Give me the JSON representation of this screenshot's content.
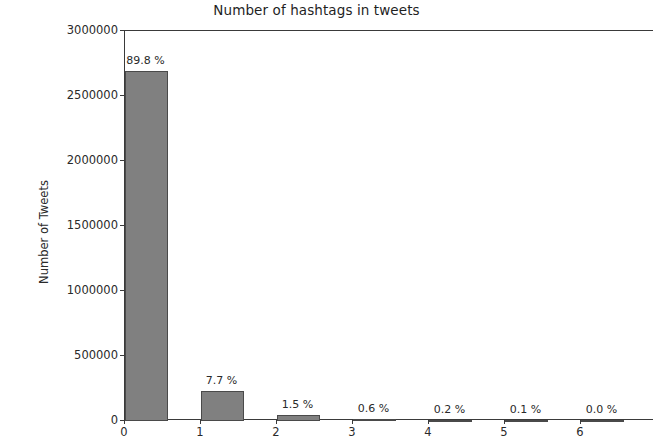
{
  "chart_data": {
    "type": "bar",
    "title": "Number of hashtags in tweets",
    "xlabel": "",
    "ylabel": "Number of Tweets",
    "categories": [
      "0",
      "1",
      "2",
      "3",
      "4",
      "5",
      "6"
    ],
    "values": [
      2694000,
      231000,
      45000,
      18000,
      6000,
      3000,
      1000
    ],
    "data_labels": [
      "89.8 %",
      "7.7 %",
      "1.5 %",
      "0.6 %",
      "0.2 %",
      "0.1 %",
      "0.0 %"
    ],
    "percentages": [
      89.8,
      7.7,
      1.5,
      0.6,
      0.2,
      0.1,
      0.0
    ],
    "ylim": [
      0,
      3000000
    ],
    "xlim": [
      -0.3,
      6.65
    ],
    "ytick_labels": [
      "0",
      "500000",
      "1000000",
      "1500000",
      "2000000",
      "2500000",
      "3000000"
    ],
    "ytick_values": [
      0,
      500000,
      1000000,
      1500000,
      2000000,
      2500000,
      3000000
    ],
    "xtick_labels": [
      "0",
      "1",
      "2",
      "3",
      "4",
      "5",
      "6"
    ],
    "grid": false,
    "legend": null,
    "bar_color": "#808080",
    "bar_edge_color": "#4a4a4a",
    "axis_color": "#3a3a3a",
    "text_color": "#2a2a2a",
    "background": "#ffffff"
  }
}
